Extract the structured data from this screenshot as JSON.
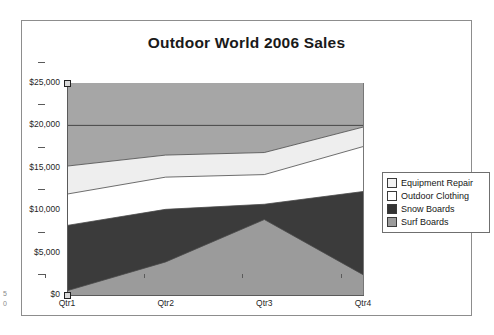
{
  "chart_data": {
    "type": "area",
    "stacked": true,
    "title": "Outdoor World 2006 Sales",
    "xlabel": "",
    "ylabel": "",
    "categories": [
      "Qtr1",
      "Qtr2",
      "Qtr3",
      "Qtr4"
    ],
    "ylim": [
      0,
      25000
    ],
    "ytick_values": [
      0,
      5000,
      10000,
      15000,
      20000,
      25000
    ],
    "ytick_labels": [
      "$0",
      "$5,000",
      "$10,000",
      "$15,000",
      "$20,000",
      "$25,000"
    ],
    "grid": true,
    "legend_position": "right",
    "series": [
      {
        "name": "Surf Boards",
        "values": [
          500,
          3900,
          8900,
          2400
        ],
        "color": "#9b9b9b"
      },
      {
        "name": "Snow Boards",
        "values": [
          7700,
          6200,
          1800,
          9800
        ],
        "color": "#3b3b3b"
      },
      {
        "name": "Outdoor Clothing",
        "values": [
          3700,
          3800,
          3500,
          5300
        ],
        "color": "#ffffff"
      },
      {
        "name": "Equipment Repair",
        "values": [
          3300,
          2600,
          2600,
          2300
        ],
        "color": "#eeeeee"
      }
    ],
    "cumulative_tops": {
      "Surf Boards": [
        500,
        3900,
        8900,
        2400
      ],
      "Snow Boards": [
        8200,
        10100,
        10700,
        12200
      ],
      "Outdoor Clothing": [
        11900,
        13900,
        14200,
        17500
      ],
      "Equipment Repair": [
        15200,
        16500,
        16800,
        19800
      ]
    },
    "plot_background_color": "#a6a6a6",
    "gridline_color": "#3c3c3c"
  },
  "legend": {
    "items": [
      {
        "label": "Equipment Repair",
        "color": "#f2f2f2"
      },
      {
        "label": "Outdoor Clothing",
        "color": "#ffffff"
      },
      {
        "label": "Snow Boards",
        "color": "#333333"
      },
      {
        "label": "Surf Boards",
        "color": "#9b9b9b"
      }
    ]
  },
  "page_marks": {
    "line1": "5",
    "line2": "0"
  }
}
